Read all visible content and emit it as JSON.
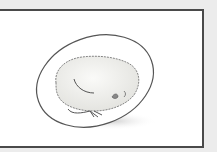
{
  "illustration": {
    "subject": "chick-embryo-in-egg",
    "colors": {
      "page_background": "#ececec",
      "frame_border": "#4a4a4a",
      "frame_fill": "#ffffff",
      "egg_outline": "#555555",
      "chick_fill": "#f2f2f0",
      "shadow": "#d8d8d8"
    }
  }
}
